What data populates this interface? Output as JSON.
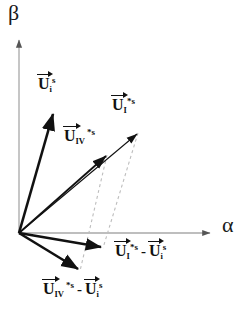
{
  "figure": {
    "background_color": "#ffffff",
    "width": 252,
    "height": 323
  },
  "axes": {
    "origin": {
      "x": 19,
      "y": 233
    },
    "color": "#a0a0a0",
    "vertical": {
      "name": "beta-axis",
      "label": "β",
      "from": {
        "x": 19,
        "y": 233
      },
      "to": {
        "x": 19,
        "y": 38
      }
    },
    "horizontal": {
      "name": "alpha-axis",
      "label": "α",
      "from": {
        "x": 19,
        "y": 233
      },
      "to": {
        "x": 212,
        "y": 233
      }
    }
  },
  "vectors": [
    {
      "id": "u-i-s",
      "base": "U",
      "sub": "i",
      "sup": "s",
      "label_plain": "U_i^s",
      "color": "#111111",
      "stroke_width": 2.6,
      "style": "solid",
      "from": {
        "x": 19,
        "y": 233
      },
      "to": {
        "x": 53,
        "y": 112
      }
    },
    {
      "id": "u-I-star-s",
      "base": "U",
      "sub": "I",
      "sup": "*s",
      "label_plain": "U_I^*s",
      "color": "#111111",
      "stroke_width": 1.1,
      "style": "solid",
      "from": {
        "x": 19,
        "y": 233
      },
      "to": {
        "x": 138,
        "y": 133
      }
    },
    {
      "id": "u-IV-star-s",
      "base": "U",
      "sub": "IV",
      "sup": "*s",
      "label_plain": "U_IV^*s",
      "color": "#111111",
      "stroke_width": 1.8,
      "style": "solid",
      "from": {
        "x": 19,
        "y": 233
      },
      "to": {
        "x": 107,
        "y": 155
      }
    },
    {
      "id": "diff-I",
      "label_plain": "U_I^*s - U_i^s",
      "color": "#111111",
      "stroke_width": 2.4,
      "style": "solid",
      "from": {
        "x": 19,
        "y": 233
      },
      "to": {
        "x": 103,
        "y": 248
      }
    },
    {
      "id": "diff-IV",
      "label_plain": "U_IV^*s - U_i^s",
      "color": "#111111",
      "stroke_width": 2.6,
      "style": "solid",
      "from": {
        "x": 19,
        "y": 233
      },
      "to": {
        "x": 80,
        "y": 271
      }
    }
  ],
  "construction_lines": [
    {
      "id": "dash-IV",
      "color": "#b5b5b5",
      "style": "dashed",
      "dash": "3,3",
      "stroke_width": 1,
      "from": {
        "x": 107,
        "y": 155
      },
      "to": {
        "x": 80,
        "y": 271
      }
    },
    {
      "id": "dash-I",
      "color": "#b5b5b5",
      "style": "dashed",
      "dash": "3,3",
      "stroke_width": 1,
      "from": {
        "x": 138,
        "y": 133
      },
      "to": {
        "x": 103,
        "y": 248
      }
    }
  ],
  "labels": {
    "beta": "β",
    "alpha": "α",
    "u_i_s": {
      "base": "U",
      "sub": "i",
      "sup": "s"
    },
    "u_I_star_s": {
      "base": "U",
      "sub": "I",
      "sup": "*s"
    },
    "u_IV_star_s": {
      "base": "U",
      "sub": "IV",
      "sup": "*s"
    },
    "diff_I": {
      "left": {
        "base": "U",
        "sub": "I",
        "sup": "*s"
      },
      "operator": "-",
      "right": {
        "base": "U",
        "sub": "i",
        "sup": "s"
      }
    },
    "diff_IV": {
      "left": {
        "base": "U",
        "sub": "IV",
        "sup": "*s"
      },
      "operator": "-",
      "right": {
        "base": "U",
        "sub": "i",
        "sup": "s"
      }
    }
  },
  "caption": {
    "text": ""
  }
}
